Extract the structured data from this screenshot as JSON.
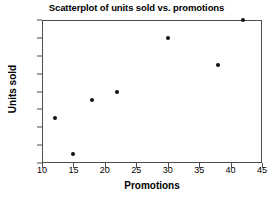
{
  "chart_data": {
    "type": "scatter",
    "title": "Scatterplot of units sold vs. promotions",
    "xlabel": "Promotions",
    "ylabel": "Units sold",
    "xlim": [
      10,
      45
    ],
    "ylim": [
      10,
      26
    ],
    "xticks": [
      10,
      15,
      20,
      25,
      30,
      35,
      40,
      45
    ],
    "yticks": [
      10,
      12,
      14,
      16,
      18,
      20,
      22,
      24,
      26
    ],
    "grid": false,
    "legend": false,
    "marker_color": "#111111",
    "frame_color": "#4d4d4d",
    "points": [
      {
        "x": 12,
        "y": 15
      },
      {
        "x": 15,
        "y": 11
      },
      {
        "x": 18,
        "y": 17
      },
      {
        "x": 22,
        "y": 18
      },
      {
        "x": 30,
        "y": 24
      },
      {
        "x": 38,
        "y": 21
      },
      {
        "x": 42,
        "y": 26
      }
    ],
    "x": [
      12,
      15,
      18,
      22,
      30,
      38,
      42
    ],
    "values": [
      15,
      11,
      17,
      18,
      24,
      21,
      26
    ]
  }
}
